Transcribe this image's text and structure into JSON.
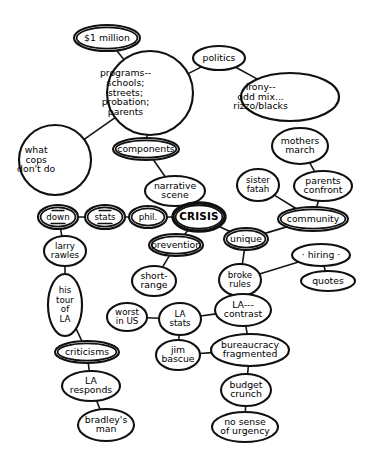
{
  "diagram": {
    "type": "concept-map",
    "width": 371,
    "height": 476,
    "background_color": "#ffffff",
    "stroke_color": "#101010",
    "text_color": "#000000",
    "nodes": [
      {
        "id": "million",
        "label": "$1 million",
        "lines": [
          "$1 million"
        ],
        "cx": 107,
        "cy": 38,
        "rx": 33,
        "ry": 13,
        "shape": "ellipse",
        "style": "double"
      },
      {
        "id": "programs",
        "label": "programs-- schools; streets; probation; parents",
        "lines": [
          "programs--",
          "schools;",
          "streets;",
          "probation;",
          "parents"
        ],
        "cx": 150,
        "cy": 93,
        "rx": 43,
        "ry": 42,
        "shape": "circle",
        "style": "plain",
        "align": "left"
      },
      {
        "id": "politics",
        "label": "politics",
        "lines": [
          "politics"
        ],
        "cx": 219,
        "cy": 58,
        "rx": 26,
        "ry": 12,
        "shape": "ellipse",
        "style": "plain"
      },
      {
        "id": "irony",
        "label": "irony-- odd mix... rizzo/blacks",
        "lines": [
          "irony--",
          "odd mix...",
          "rizzo/blacks"
        ],
        "cx": 290,
        "cy": 97,
        "rx": 49,
        "ry": 24,
        "shape": "ellipse",
        "style": "plain",
        "align": "left"
      },
      {
        "id": "mothers",
        "label": "mothers march",
        "lines": [
          "mothers",
          "march"
        ],
        "cx": 300,
        "cy": 146,
        "rx": 28,
        "ry": 18,
        "shape": "ellipse",
        "style": "plain"
      },
      {
        "id": "whatcops",
        "label": "what cops don't do",
        "lines": [
          "what",
          "cops",
          "don't do"
        ],
        "cx": 55,
        "cy": 160,
        "rx": 36,
        "ry": 35,
        "shape": "circle",
        "style": "plain",
        "align": "left"
      },
      {
        "id": "components",
        "label": "components",
        "lines": [
          "components"
        ],
        "cx": 146,
        "cy": 149,
        "rx": 33,
        "ry": 11,
        "shape": "ellipse",
        "style": "double"
      },
      {
        "id": "narrative",
        "label": "narrative scene",
        "lines": [
          "narrative",
          "scene"
        ],
        "cx": 175,
        "cy": 191,
        "rx": 30,
        "ry": 15,
        "shape": "ellipse",
        "style": "plain"
      },
      {
        "id": "down",
        "label": "down",
        "lines": [
          "down"
        ],
        "cx": 58,
        "cy": 217,
        "rx": 20,
        "ry": 12,
        "shape": "ellipse",
        "style": "double",
        "mark": "underline"
      },
      {
        "id": "stats",
        "label": "stats",
        "lines": [
          "stats"
        ],
        "cx": 105,
        "cy": 217,
        "rx": 20,
        "ry": 12,
        "shape": "ellipse",
        "style": "double",
        "mark": "underline"
      },
      {
        "id": "phil",
        "label": "phil.",
        "lines": [
          "phil."
        ],
        "cx": 148,
        "cy": 217,
        "rx": 19,
        "ry": 11,
        "shape": "ellipse",
        "style": "double"
      },
      {
        "id": "crisis",
        "label": "CRISIS",
        "lines": [
          "CRISIS"
        ],
        "cx": 199,
        "cy": 217,
        "rx": 26,
        "ry": 14,
        "shape": "ellipse",
        "style": "heavy"
      },
      {
        "id": "sisterfatah",
        "label": "sister fatah",
        "lines": [
          "sister",
          "fatah"
        ],
        "cx": 258,
        "cy": 185,
        "rx": 21,
        "ry": 16,
        "shape": "ellipse",
        "style": "plain"
      },
      {
        "id": "parentsconf",
        "label": "parents confront",
        "lines": [
          "parents",
          "confront"
        ],
        "cx": 323,
        "cy": 186,
        "rx": 29,
        "ry": 15,
        "shape": "ellipse",
        "style": "plain"
      },
      {
        "id": "community",
        "label": "community",
        "lines": [
          "community"
        ],
        "cx": 313,
        "cy": 219,
        "rx": 35,
        "ry": 12,
        "shape": "ellipse",
        "style": "double"
      },
      {
        "id": "unique",
        "label": "unique",
        "lines": [
          "unique"
        ],
        "cx": 246,
        "cy": 239,
        "rx": 22,
        "ry": 11,
        "shape": "ellipse",
        "style": "double"
      },
      {
        "id": "hiring",
        "label": "· hiring ·",
        "lines": [
          "· hiring ·"
        ],
        "cx": 321,
        "cy": 255,
        "rx": 29,
        "ry": 11,
        "shape": "ellipse",
        "style": "plain"
      },
      {
        "id": "prevention",
        "label": "prevention",
        "lines": [
          "prevention"
        ],
        "cx": 176,
        "cy": 245,
        "rx": 27,
        "ry": 11,
        "shape": "ellipse",
        "style": "double"
      },
      {
        "id": "quotes",
        "label": "quotes",
        "lines": [
          "quotes"
        ],
        "cx": 328,
        "cy": 281,
        "rx": 27,
        "ry": 10,
        "shape": "ellipse",
        "style": "plain"
      },
      {
        "id": "shortrange",
        "label": "short- range",
        "lines": [
          "short-",
          "range"
        ],
        "cx": 154,
        "cy": 281,
        "rx": 22,
        "ry": 15,
        "shape": "ellipse",
        "style": "plain"
      },
      {
        "id": "brokerules",
        "label": "broke rules",
        "lines": [
          "broke",
          "rules"
        ],
        "cx": 240,
        "cy": 280,
        "rx": 21,
        "ry": 16,
        "shape": "ellipse",
        "style": "plain"
      },
      {
        "id": "larryrawles",
        "label": "larry rawles",
        "lines": [
          "larry",
          "rawles"
        ],
        "cx": 65,
        "cy": 251,
        "rx": 21,
        "ry": 15,
        "shape": "ellipse",
        "style": "plain"
      },
      {
        "id": "worstinus",
        "label": "worst in US",
        "lines": [
          "worst",
          "in US"
        ],
        "cx": 127,
        "cy": 317,
        "rx": 20,
        "ry": 14,
        "shape": "ellipse",
        "style": "plain"
      },
      {
        "id": "lastats",
        "label": "LA stats",
        "lines": [
          "LA",
          "stats"
        ],
        "cx": 180,
        "cy": 319,
        "rx": 21,
        "ry": 16,
        "shape": "ellipse",
        "style": "plain"
      },
      {
        "id": "lacontrast",
        "label": "LA--- contrast",
        "lines": [
          "LA---",
          "contrast"
        ],
        "cx": 243,
        "cy": 310,
        "rx": 28,
        "ry": 16,
        "shape": "ellipse",
        "style": "plain"
      },
      {
        "id": "histour",
        "label": "his tour of LA",
        "lines": [
          "his",
          "tour",
          "of",
          "LA"
        ],
        "cx": 65,
        "cy": 305,
        "rx": 17,
        "ry": 31,
        "shape": "ellipse",
        "style": "plain"
      },
      {
        "id": "jimbascue",
        "label": "jim bascue",
        "lines": [
          "jim",
          "bascue"
        ],
        "cx": 178,
        "cy": 355,
        "rx": 22,
        "ry": 15,
        "shape": "ellipse",
        "style": "plain"
      },
      {
        "id": "bureaucracy",
        "label": "bureaucracy fragmented",
        "lines": [
          "bureaucracy",
          "fragmented"
        ],
        "cx": 250,
        "cy": 350,
        "rx": 39,
        "ry": 16,
        "shape": "ellipse",
        "style": "plain"
      },
      {
        "id": "criticisms",
        "label": "criticisms",
        "lines": [
          "criticisms"
        ],
        "cx": 87,
        "cy": 352,
        "rx": 32,
        "ry": 11,
        "shape": "ellipse",
        "style": "double"
      },
      {
        "id": "budget",
        "label": "budget crunch",
        "lines": [
          "budget",
          "crunch"
        ],
        "cx": 246,
        "cy": 390,
        "rx": 25,
        "ry": 16,
        "shape": "ellipse",
        "style": "plain"
      },
      {
        "id": "laresponds",
        "label": "LA responds",
        "lines": [
          "LA",
          "responds"
        ],
        "cx": 91,
        "cy": 386,
        "rx": 29,
        "ry": 15,
        "shape": "ellipse",
        "style": "plain"
      },
      {
        "id": "nosense",
        "label": "no sense of urgency",
        "lines": [
          "no sense",
          "of urgency"
        ],
        "cx": 245,
        "cy": 427,
        "rx": 33,
        "ry": 15,
        "shape": "ellipse",
        "style": "plain"
      },
      {
        "id": "bradleysman",
        "label": "bradley's man",
        "lines": [
          "bradley's",
          "man"
        ],
        "cx": 106,
        "cy": 425,
        "rx": 28,
        "ry": 16,
        "shape": "ellipse",
        "style": "plain"
      }
    ],
    "edges": [
      {
        "from": "million",
        "to": "programs"
      },
      {
        "from": "programs",
        "to": "politics"
      },
      {
        "from": "politics",
        "to": "irony"
      },
      {
        "from": "programs",
        "to": "whatcops"
      },
      {
        "from": "programs",
        "to": "components"
      },
      {
        "from": "components",
        "to": "narrative"
      },
      {
        "from": "narrative",
        "to": "crisis"
      },
      {
        "from": "down",
        "to": "stats"
      },
      {
        "from": "stats",
        "to": "phil"
      },
      {
        "from": "phil",
        "to": "crisis"
      },
      {
        "from": "down",
        "to": "larryrawles"
      },
      {
        "from": "larryrawles",
        "to": "histour"
      },
      {
        "from": "histour",
        "to": "criticisms"
      },
      {
        "from": "criticisms",
        "to": "laresponds"
      },
      {
        "from": "laresponds",
        "to": "bradleysman"
      },
      {
        "from": "crisis",
        "to": "prevention"
      },
      {
        "from": "prevention",
        "to": "shortrange"
      },
      {
        "from": "crisis",
        "to": "unique"
      },
      {
        "from": "unique",
        "to": "community"
      },
      {
        "from": "community",
        "to": "sisterfatah"
      },
      {
        "from": "community",
        "to": "parentsconf"
      },
      {
        "from": "parentsconf",
        "to": "mothers"
      },
      {
        "from": "unique",
        "to": "brokerules"
      },
      {
        "from": "brokerules",
        "to": "hiring"
      },
      {
        "from": "hiring",
        "to": "quotes"
      },
      {
        "from": "brokerules",
        "to": "lacontrast"
      },
      {
        "from": "lacontrast",
        "to": "lastats"
      },
      {
        "from": "lastats",
        "to": "worstinus"
      },
      {
        "from": "lastats",
        "to": "jimbascue"
      },
      {
        "from": "jimbascue",
        "to": "bureaucracy"
      },
      {
        "from": "lacontrast",
        "to": "bureaucracy"
      },
      {
        "from": "bureaucracy",
        "to": "budget"
      },
      {
        "from": "budget",
        "to": "nosense"
      }
    ]
  }
}
